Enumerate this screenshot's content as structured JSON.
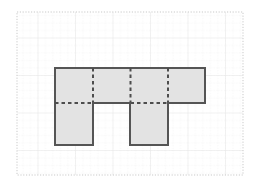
{
  "figure": {
    "title": "",
    "background_color": "#ffffff",
    "plot_area": {
      "x": 17,
      "y": 12,
      "width": 226,
      "height": 163,
      "border_style": "dotted",
      "border_color": "#bdbdbd"
    },
    "grid": {
      "major_color": "#e8e8e8",
      "minor_color": "#dcdcdc",
      "minor_style": "dotted",
      "major_spacing_px": 37.5,
      "minor_spacing_px": 7.5,
      "major_x": [
        17,
        54.5,
        92,
        129.5,
        167,
        204.5,
        242
      ],
      "major_y": [
        12,
        30.5,
        68,
        105.5,
        143,
        175
      ],
      "visible": true
    }
  },
  "chart_data": {
    "type": "diagram",
    "shape_name": "composite-polygon",
    "fill_color": "#e3e3e3",
    "stroke_color": "#555555",
    "stroke_width": 2,
    "dash_color": "#4d4d4d",
    "unit_px": 37.5,
    "outline_points": [
      [
        55,
        68
      ],
      [
        205,
        68
      ],
      [
        205,
        103
      ],
      [
        168,
        103
      ],
      [
        168,
        145
      ],
      [
        130,
        145
      ],
      [
        130,
        103
      ],
      [
        93,
        103
      ],
      [
        93,
        145
      ],
      [
        55,
        145
      ]
    ],
    "interior_dashed_segments": [
      {
        "name": "vertical-divider-1",
        "x1": 93,
        "y1": 68,
        "x2": 93,
        "y2": 103
      },
      {
        "name": "vertical-divider-2",
        "x1": 130.5,
        "y1": 68,
        "x2": 130.5,
        "y2": 103
      },
      {
        "name": "vertical-divider-3",
        "x1": 168,
        "y1": 68,
        "x2": 168,
        "y2": 103
      },
      {
        "name": "horizontal-divider-left",
        "x1": 55,
        "y1": 103,
        "x2": 93,
        "y2": 103
      },
      {
        "name": "horizontal-divider-right",
        "x1": 130.5,
        "y1": 103,
        "x2": 168,
        "y2": 103
      }
    ],
    "solid_interior_segments": [
      {
        "name": "band-bottom-middle",
        "x1": 93,
        "y1": 103,
        "x2": 130.5,
        "y2": 103
      },
      {
        "name": "band-bottom-right",
        "x1": 168,
        "y1": 103,
        "x2": 205,
        "y2": 103
      }
    ],
    "unit_squares_count": 10,
    "top_band": {
      "x": 55,
      "y": 68,
      "width": 150,
      "height": 35,
      "units": 4
    },
    "left_leg": {
      "x": 55,
      "y": 103,
      "width": 38,
      "height": 42,
      "units": 1
    },
    "right_leg": {
      "x": 130.5,
      "y": 103,
      "width": 37.5,
      "height": 42,
      "units": 1
    },
    "xlabel": "",
    "ylabel": "",
    "legend": [],
    "annotations": []
  }
}
